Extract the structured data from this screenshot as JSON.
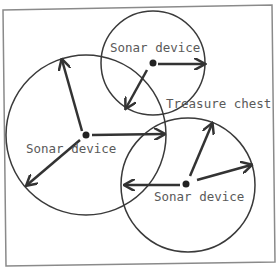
{
  "diagram": {
    "colors": {
      "line": "#333333",
      "text": "#5a5a5a",
      "frame": "#8a8a8a",
      "background": "#ffffff"
    },
    "devices": [
      {
        "label": "Sonar device",
        "cx": 153,
        "cy": 63,
        "r": 52
      },
      {
        "label": "Sonar device",
        "cx": 86,
        "cy": 135,
        "r": 80
      },
      {
        "label": "Sonar device",
        "cx": 186,
        "cy": 184,
        "r": 67
      }
    ],
    "target": {
      "label": "Treasure chest"
    }
  }
}
